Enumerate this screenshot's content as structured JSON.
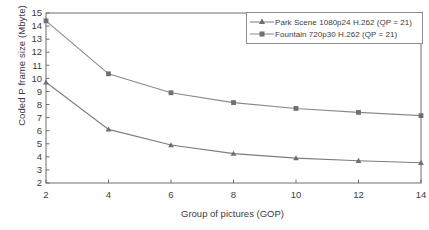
{
  "chart_data": {
    "type": "line",
    "title": "",
    "xlabel": "Group of pictures (GOP)",
    "ylabel": "Coded P frame size (Mbyte)",
    "x": [
      2,
      4,
      6,
      8,
      10,
      12,
      14
    ],
    "xlim": [
      2,
      14
    ],
    "ylim": [
      2,
      15
    ],
    "xticks": [
      "2",
      "4",
      "6",
      "8",
      "10",
      "12",
      "14"
    ],
    "yticks": [
      "2",
      "3",
      "4",
      "5",
      "6",
      "7",
      "8",
      "9",
      "10",
      "11",
      "12",
      "13",
      "14",
      "15"
    ],
    "grid": false,
    "legend_position": "upper right",
    "series": [
      {
        "name": "Park Scene 1080p24 H.262 (QP = 21)",
        "marker": "triangle",
        "color": "#7d7d7d",
        "values": [
          9.7,
          6.1,
          4.9,
          4.25,
          3.9,
          3.7,
          3.55
        ]
      },
      {
        "name": "Fountain 720p30 H.262 (QP = 21)",
        "marker": "square",
        "color": "#8a8a8a",
        "values": [
          14.4,
          10.35,
          8.9,
          8.15,
          7.7,
          7.4,
          7.15
        ]
      }
    ]
  },
  "legend": {
    "entries": [
      {
        "label": "Park Scene 1080p24 H.262 (QP = 21)"
      },
      {
        "label": "Fountain 720p30 H.262 (QP = 21)"
      }
    ]
  },
  "axes": {
    "x_title": "Group of pictures (GOP)",
    "y_title": "Coded P frame size (Mbyte)"
  },
  "colors": {
    "axis": "#6e6e6e",
    "series_park": "#7d7d7d",
    "series_fountain": "#8a8a8a",
    "text": "#3c3c3c",
    "background": "#ffffff"
  }
}
